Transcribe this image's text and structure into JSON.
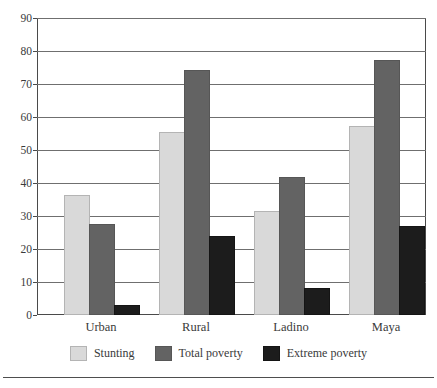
{
  "chart_data": {
    "type": "bar",
    "title": "",
    "subtitle": "",
    "xlabel": "",
    "ylabel": "",
    "categories": [
      "Urban",
      "Rural",
      "Ladino",
      "Maya"
    ],
    "series": [
      {
        "name": "Stunting",
        "color": "#d9d9d9",
        "values": [
          36,
          55,
          31,
          57
        ]
      },
      {
        "name": "Total poverty",
        "color": "#636363",
        "values": [
          27,
          74,
          41.5,
          77
        ]
      },
      {
        "name": "Extreme poverty",
        "color": "#1c1c1c",
        "values": [
          2.5,
          23.5,
          7.5,
          26.5
        ]
      }
    ],
    "ylim": [
      0,
      90
    ],
    "yticks": [
      0,
      10,
      20,
      30,
      40,
      50,
      60,
      70,
      80,
      90
    ],
    "ytick_labels": [
      "0",
      "10",
      "20",
      "30",
      "40",
      "50",
      "60",
      "70",
      "80",
      "90"
    ],
    "grid": true,
    "grid_axis": "y",
    "legend_position": "bottom"
  },
  "axis": {
    "y_labels": [
      "90",
      "80",
      "70",
      "60",
      "50",
      "40",
      "30",
      "20",
      "10",
      "0"
    ],
    "x_labels": [
      "Urban",
      "Rural",
      "Ladino",
      "Maya"
    ]
  },
  "legend": {
    "items": [
      {
        "label": "Stunting"
      },
      {
        "label": "Total poverty"
      },
      {
        "label": "Extreme poverty"
      }
    ]
  }
}
